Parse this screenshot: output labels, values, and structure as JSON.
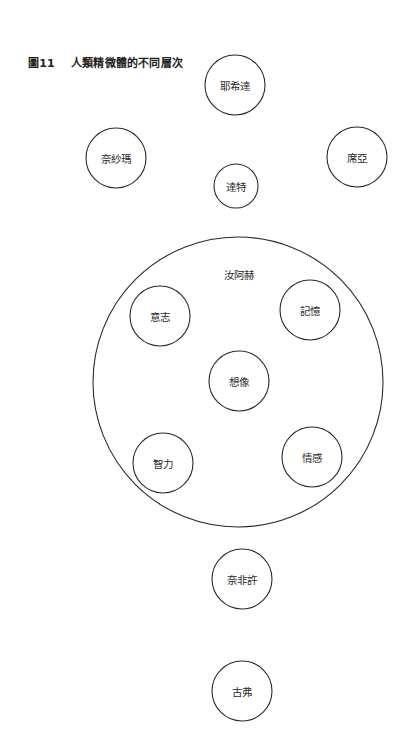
{
  "figure": {
    "number": "圖11",
    "title": "人類精微體的不同層次"
  },
  "outer_container": {
    "label": "汝阿赫",
    "cx": 238,
    "cy": 382,
    "r": 145,
    "label_x": 239,
    "label_y": 274
  },
  "nodes": [
    {
      "id": "yehida",
      "label": "耶希達",
      "cx": 235,
      "cy": 85,
      "r": 30
    },
    {
      "id": "neshama",
      "label": "奈紗瑪",
      "cx": 116,
      "cy": 158,
      "r": 30
    },
    {
      "id": "chaya",
      "label": "席亞",
      "cx": 357,
      "cy": 157,
      "r": 30
    },
    {
      "id": "daat",
      "label": "達特",
      "cx": 236,
      "cy": 186,
      "r": 22
    },
    {
      "id": "will",
      "label": "意志",
      "cx": 160,
      "cy": 316,
      "r": 30
    },
    {
      "id": "memory",
      "label": "記憶",
      "cx": 310,
      "cy": 310,
      "r": 30
    },
    {
      "id": "imagination",
      "label": "想像",
      "cx": 239,
      "cy": 381,
      "r": 30
    },
    {
      "id": "intellect",
      "label": "智力",
      "cx": 163,
      "cy": 463,
      "r": 30
    },
    {
      "id": "emotion",
      "label": "情感",
      "cx": 312,
      "cy": 457,
      "r": 30
    },
    {
      "id": "nefesh",
      "label": "奈非許",
      "cx": 242,
      "cy": 579,
      "r": 30
    },
    {
      "id": "guf",
      "label": "古弗",
      "cx": 242,
      "cy": 691,
      "r": 30
    }
  ],
  "colors": {
    "stroke": "#2a2a2a",
    "text": "#2a2a2a",
    "background": "#ffffff"
  }
}
